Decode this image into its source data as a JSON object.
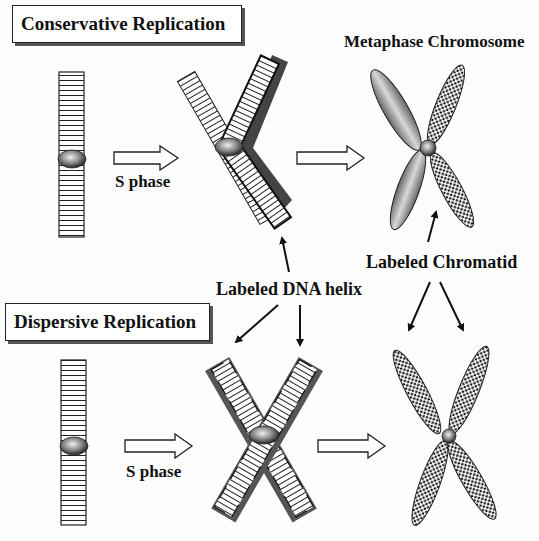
{
  "diagram": {
    "sections": [
      {
        "title": "Conservative Replication",
        "step_label": "S phase"
      },
      {
        "title": "Dispersive Replication",
        "step_label": "S phase"
      }
    ],
    "labels": {
      "metaphase_chromosome": "Metaphase Chromosome",
      "labeled_dna_helix": "Labeled DNA helix",
      "labeled_chromatid": "Labeled Chromatid"
    },
    "colors": {
      "strand_outline": "#222222",
      "labeled_shadow": "#555555",
      "centromere": "#8a8a8a",
      "unlabeled_chromatid": "#9a9a9a",
      "background": "#ffffff"
    }
  }
}
